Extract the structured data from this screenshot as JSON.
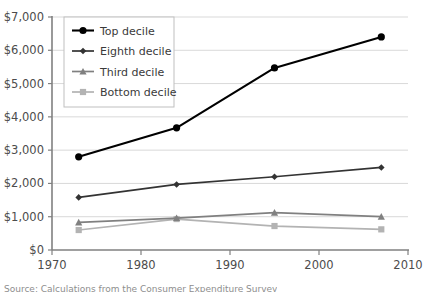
{
  "chart_data": {
    "type": "line",
    "title": "",
    "subtitle": "",
    "xlabel": "",
    "ylabel": "",
    "x": [
      1973,
      1984,
      1995,
      2007
    ],
    "xlim": [
      1970,
      2010
    ],
    "ylim": [
      0,
      7000
    ],
    "grid": true,
    "legend_position": "top-left-inside",
    "xticks": [
      1970,
      1980,
      1990,
      2000,
      2010
    ],
    "xticklabels": [
      "1970",
      "1980",
      "1990",
      "2000",
      "2010"
    ],
    "yticks": [
      0,
      1000,
      2000,
      3000,
      4000,
      5000,
      6000,
      7000
    ],
    "yticklabels": [
      "$0",
      "$1,000",
      "$2,000",
      "$3,000",
      "$4,000",
      "$5,000",
      "$6,000",
      "$7,000"
    ],
    "series": [
      {
        "name": "Top decile",
        "values": [
          2800,
          3670,
          5470,
          6400
        ],
        "color": "#000000",
        "marker": "circle"
      },
      {
        "name": "Eighth decile",
        "values": [
          1580,
          1970,
          2200,
          2480
        ],
        "color": "#333333",
        "marker": "diamond"
      },
      {
        "name": "Third decile",
        "values": [
          830,
          960,
          1120,
          1000
        ],
        "color": "#808080",
        "marker": "triangle"
      },
      {
        "name": "Bottom decile",
        "values": [
          600,
          930,
          720,
          620
        ],
        "color": "#b3b3b3",
        "marker": "square"
      }
    ]
  },
  "legend": {
    "items": [
      {
        "label": "Top decile"
      },
      {
        "label": "Eighth decile"
      },
      {
        "label": "Third decile"
      },
      {
        "label": "Bottom decile"
      }
    ]
  },
  "footer": {
    "source_note": "Source: Calculations from the Consumer Expenditure Survey"
  }
}
